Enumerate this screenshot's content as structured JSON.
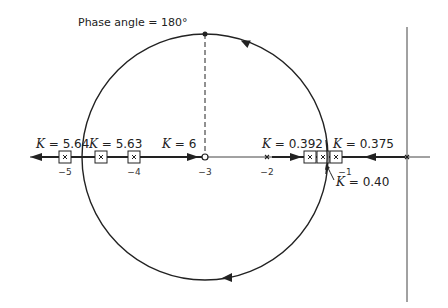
{
  "figure": {
    "title_annotation": "Phase angle = 180°",
    "axis_ticks": [
      {
        "label": "−5",
        "x": 65
      },
      {
        "label": "−4",
        "x": 134
      },
      {
        "label": "−3",
        "x": 205
      },
      {
        "label": "−2",
        "x": 267
      },
      {
        "label": "−1",
        "x": 340
      }
    ],
    "gain_labels": [
      {
        "var": "K",
        "text": " = 5.64"
      },
      {
        "var": "K",
        "text": " = 5.63"
      },
      {
        "var": "K",
        "text": " = 6"
      },
      {
        "var": "K",
        "text": " = 0.392"
      },
      {
        "var": "K",
        "text": " = 0.375"
      },
      {
        "var": "K",
        "text": " = 0.40"
      }
    ],
    "colors": {
      "line": "#222222",
      "background": "#ffffff"
    }
  }
}
